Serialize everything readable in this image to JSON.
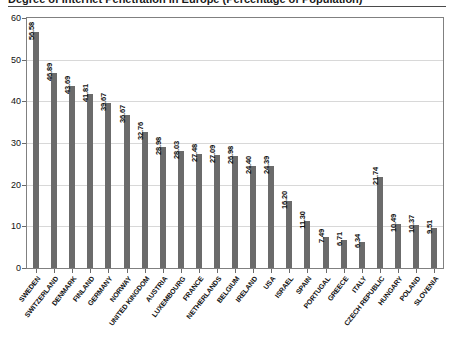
{
  "chart_data": {
    "type": "bar",
    "title": "Degree of Internet Penetration in Europe (Percentage of Population)",
    "xlabel": "",
    "ylabel": "",
    "ylim": [
      0,
      60
    ],
    "yticks": [
      0,
      10,
      20,
      30,
      40,
      50,
      60
    ],
    "ytick_labels": [
      "0",
      "10",
      "20",
      "30",
      "40",
      "50",
      "60"
    ],
    "grid": true,
    "grid_axis": "y",
    "legend": false,
    "bar_color": "#6b6b6b",
    "value_labels": true,
    "value_label_rotation": -90,
    "categories": [
      "SWEDEN",
      "SWITZERLAND",
      "DENMARK",
      "FINLAND",
      "GERMANY",
      "NORWAY",
      "UNITED KINGDOM",
      "AUSTRIA",
      "LUXEMBOURG",
      "FRANCE",
      "NETHERLANDS",
      "BELGIUM",
      "IRELAND",
      "USA",
      "ISRAEL",
      "SPAIN",
      "PORTUGAL",
      "GREECE",
      "ITALY",
      "CZECH REPUBLIC",
      "HUNGARY",
      "POLAND",
      "SLOVENIA"
    ],
    "values": [
      56.58,
      46.89,
      43.69,
      41.81,
      39.67,
      36.67,
      32.76,
      28.98,
      28.03,
      27.48,
      27.09,
      26.98,
      24.4,
      24.39,
      16.2,
      11.3,
      7.49,
      6.71,
      6.34,
      21.74,
      10.49,
      10.37,
      9.51
    ],
    "value_labels_text": [
      "56.58",
      "46.89",
      "43.69",
      "41.81",
      "39.67",
      "36.67",
      "32.76",
      "28.98",
      "28.03",
      "27.48",
      "27.09",
      "26.98",
      "24.40",
      "24.39",
      "16.20",
      "11.30",
      "7.49",
      "6.71",
      "6.34",
      "21.74",
      "10.49",
      "10.37",
      "9.51"
    ]
  }
}
